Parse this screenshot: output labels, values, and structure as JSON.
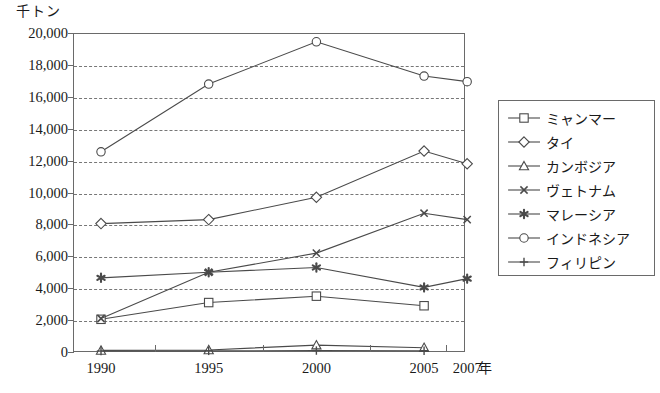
{
  "chart_data": {
    "type": "line",
    "title": "",
    "ylabel": "千トン",
    "xlabel": "年",
    "grid": true,
    "legend_position": "right",
    "ylim": [
      0,
      20000
    ],
    "ytick_labels": [
      "20,000",
      "18,000",
      "16,000",
      "14,000",
      "12,000",
      "10,000",
      "8,000",
      "6,000",
      "4,000",
      "2,000",
      "0"
    ],
    "ytick_values": [
      20000,
      18000,
      16000,
      14000,
      12000,
      10000,
      8000,
      6000,
      4000,
      2000,
      0
    ],
    "categories": [
      "1990",
      "1995",
      "2000",
      "2005",
      "2007"
    ],
    "x": [
      1990,
      1995,
      2000,
      2005,
      2007
    ],
    "series": [
      {
        "name": "ミャンマー",
        "marker": "square-open",
        "values": [
          2050,
          3100,
          3500,
          2900,
          null
        ]
      },
      {
        "name": "タイ",
        "marker": "diamond-open",
        "values": [
          8050,
          8300,
          9700,
          12600,
          11800
        ]
      },
      {
        "name": "カンボジア",
        "marker": "triangle-open",
        "values": [
          100,
          130,
          430,
          270,
          null
        ]
      },
      {
        "name": "ヴェトナム",
        "marker": "x-cross",
        "values": [
          2100,
          5000,
          6200,
          8700,
          8300
        ]
      },
      {
        "name": "マレーシア",
        "marker": "star-filled",
        "values": [
          4650,
          5000,
          5300,
          4050,
          4600
        ]
      },
      {
        "name": "インドネシア",
        "marker": "circle-open",
        "values": [
          12550,
          16800,
          19450,
          17300,
          16950
        ]
      },
      {
        "name": "フィリピン",
        "marker": "plus",
        "values": [
          60,
          70,
          90,
          80,
          null
        ]
      }
    ]
  },
  "legend": {
    "items": [
      {
        "label": "ミャンマー",
        "marker": "square-open"
      },
      {
        "label": "タイ",
        "marker": "diamond-open"
      },
      {
        "label": "カンボジア",
        "marker": "triangle-open"
      },
      {
        "label": "ヴェトナム",
        "marker": "x-cross"
      },
      {
        "label": "マレーシア",
        "marker": "star-filled"
      },
      {
        "label": "インドネシア",
        "marker": "circle-open"
      },
      {
        "label": "フィリピン",
        "marker": "plus"
      }
    ]
  },
  "colors": {
    "line": "#4a4a4a",
    "axis": "#6a6a6a",
    "grid": "#777777",
    "text": "#1a1a1a",
    "background": "#ffffff"
  }
}
